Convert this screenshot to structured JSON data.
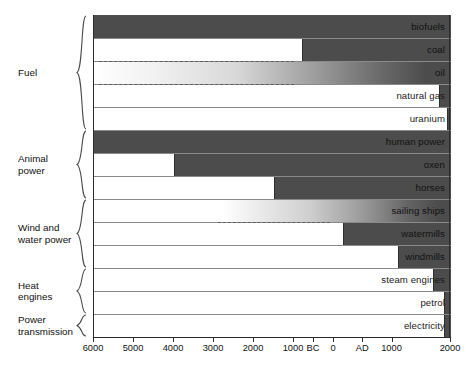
{
  "chart_data": {
    "type": "bar",
    "orientation": "horizontal",
    "title": "",
    "subtitle": "",
    "xlabel": "",
    "ylabel": "",
    "grid": false,
    "legend": null,
    "xaxis": {
      "note": "Years: negative = BC, positive = AD",
      "range": [
        -6000,
        2000
      ],
      "tick_values": [
        -6000,
        -5000,
        -4000,
        -3000,
        -2000,
        -1000,
        -500,
        0,
        500,
        1000,
        2000
      ],
      "tick_labels": [
        "6000",
        "5000",
        "4000",
        "3000",
        "2000",
        "1000",
        "BC",
        "0",
        "AD",
        "1000",
        "2000"
      ]
    },
    "categories": [
      "biofuels",
      "coal",
      "oil",
      "natural gas",
      "uranium",
      "human power",
      "oxen",
      "horses",
      "sailing ships",
      "watermills",
      "windmills",
      "steam engines",
      "petrol",
      "electricity"
    ],
    "bars": [
      {
        "label": "biofuels",
        "group": "Fuel",
        "start": -6000,
        "end": 2000,
        "fill": "solid",
        "label_on": "dark",
        "dashed_lead": null
      },
      {
        "label": "coal",
        "group": "Fuel",
        "start": -800,
        "end": 2000,
        "fill": "solid",
        "label_on": "dark",
        "dashed_lead": null
      },
      {
        "label": "oil",
        "group": "Fuel",
        "start": -6000,
        "end": 2000,
        "fill": "gradient",
        "label_on": "dark",
        "dashed_lead": -6000
      },
      {
        "label": "natural gas",
        "group": "Fuel",
        "start": 1800,
        "end": 2000,
        "fill": "solid",
        "label_on": "light",
        "dashed_lead": null
      },
      {
        "label": "uranium",
        "group": "Fuel",
        "start": 1940,
        "end": 2000,
        "fill": "solid",
        "label_on": "light",
        "dashed_lead": null
      },
      {
        "label": "human power",
        "group": "Animal power",
        "start": -6000,
        "end": 2000,
        "fill": "solid",
        "label_on": "dark",
        "dashed_lead": null
      },
      {
        "label": "oxen",
        "group": "Animal power",
        "start": -4000,
        "end": 2000,
        "fill": "solid",
        "label_on": "dark",
        "dashed_lead": null
      },
      {
        "label": "horses",
        "group": "Animal power",
        "start": -1500,
        "end": 2000,
        "fill": "solid",
        "label_on": "dark",
        "dashed_lead": null
      },
      {
        "label": "sailing ships",
        "group": "Wind and water power",
        "start": -2800,
        "end": 2000,
        "fill": "gradient",
        "label_on": "dark",
        "dashed_lead": -2800
      },
      {
        "label": "watermills",
        "group": "Wind and water power",
        "start": 150,
        "end": 2000,
        "fill": "solid",
        "label_on": "dark",
        "dashed_lead": null
      },
      {
        "label": "windmills",
        "group": "Wind and water power",
        "start": 1100,
        "end": 2000,
        "fill": "solid",
        "label_on": "dark",
        "dashed_lead": null
      },
      {
        "label": "steam engines",
        "group": "Heat engines",
        "start": 1700,
        "end": 2000,
        "fill": "solid",
        "label_on": "light",
        "dashed_lead": null
      },
      {
        "label": "petrol",
        "group": "Heat engines",
        "start": 1880,
        "end": 2000,
        "fill": "solid",
        "label_on": "light",
        "dashed_lead": null
      },
      {
        "label": "electricity",
        "group": "Power transmission",
        "start": 1880,
        "end": 2000,
        "fill": "solid",
        "label_on": "light",
        "dashed_lead": null
      }
    ],
    "groups": [
      {
        "name": "Fuel",
        "line1": "Fuel",
        "line2": "",
        "first_row": 0,
        "last_row": 4
      },
      {
        "name": "Animal power",
        "line1": "Animal",
        "line2": "power",
        "first_row": 5,
        "last_row": 7
      },
      {
        "name": "Wind and water power",
        "line1": "Wind and",
        "line2": "water power",
        "first_row": 8,
        "last_row": 10
      },
      {
        "name": "Heat engines",
        "line1": "Heat",
        "line2": "engines",
        "first_row": 11,
        "last_row": 12
      },
      {
        "name": "Power transmission",
        "line1": "Power",
        "line2": "transmission",
        "first_row": 13,
        "last_row": 13
      }
    ],
    "colors": {
      "bar_fill": "#4c4c4c",
      "background": "#ffffff",
      "axis": "#2b2b2b",
      "row_divider": "#8a8a8a",
      "text": "#111111"
    }
  }
}
